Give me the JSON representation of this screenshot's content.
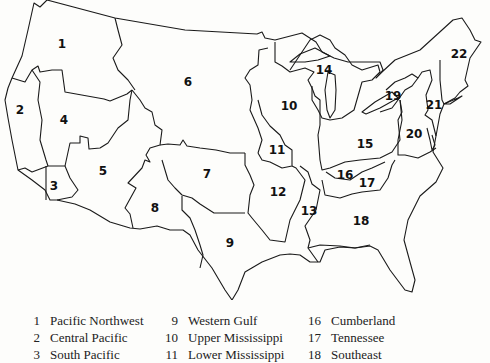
{
  "map": {
    "title": "Water resource regions of the conterminous United States",
    "regions": [
      {
        "id": 1,
        "label": "1",
        "x": 62,
        "y": 44
      },
      {
        "id": 2,
        "label": "2",
        "x": 20,
        "y": 110
      },
      {
        "id": 3,
        "label": "3",
        "x": 54,
        "y": 186
      },
      {
        "id": 4,
        "label": "4",
        "x": 64,
        "y": 120
      },
      {
        "id": 5,
        "label": "5",
        "x": 103,
        "y": 171
      },
      {
        "id": 6,
        "label": "6",
        "x": 188,
        "y": 82
      },
      {
        "id": 7,
        "label": "7",
        "x": 207,
        "y": 174
      },
      {
        "id": 8,
        "label": "8",
        "x": 155,
        "y": 208
      },
      {
        "id": 9,
        "label": "9",
        "x": 230,
        "y": 243
      },
      {
        "id": 10,
        "label": "10",
        "x": 289,
        "y": 106
      },
      {
        "id": 11,
        "label": "11",
        "x": 277,
        "y": 150
      },
      {
        "id": 12,
        "label": "12",
        "x": 278,
        "y": 192
      },
      {
        "id": 13,
        "label": "13",
        "x": 309,
        "y": 211
      },
      {
        "id": 14,
        "label": "14",
        "x": 324,
        "y": 70
      },
      {
        "id": 15,
        "label": "15",
        "x": 365,
        "y": 144
      },
      {
        "id": 16,
        "label": "16",
        "x": 345,
        "y": 175
      },
      {
        "id": 17,
        "label": "17",
        "x": 367,
        "y": 183
      },
      {
        "id": 18,
        "label": "18",
        "x": 361,
        "y": 221
      },
      {
        "id": 19,
        "label": "19",
        "x": 393,
        "y": 96
      },
      {
        "id": 20,
        "label": "20",
        "x": 414,
        "y": 134
      },
      {
        "id": 21,
        "label": "21",
        "x": 434,
        "y": 105
      },
      {
        "id": 22,
        "label": "22",
        "x": 459,
        "y": 54
      }
    ]
  },
  "legend": {
    "columns": [
      [
        {
          "num": "1",
          "name": "Pacific Northwest"
        },
        {
          "num": "2",
          "name": "Central Pacific"
        },
        {
          "num": "3",
          "name": "South Pacific"
        }
      ],
      [
        {
          "num": "9",
          "name": "Western Gulf"
        },
        {
          "num": "10",
          "name": "Upper Mississippi"
        },
        {
          "num": "11",
          "name": "Lower Mississippi"
        }
      ],
      [
        {
          "num": "16",
          "name": "Cumberland"
        },
        {
          "num": "17",
          "name": "Tennessee"
        },
        {
          "num": "18",
          "name": "Southeast"
        }
      ]
    ]
  }
}
